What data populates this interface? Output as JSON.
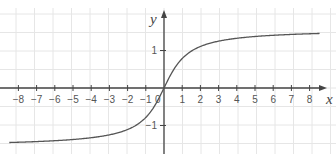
{
  "chart_data": {
    "type": "line",
    "title": "",
    "function": "y = arctan(x)",
    "xlabel": "x",
    "ylabel": "y",
    "xlim": [
      -8.5,
      9.2
    ],
    "ylim": [
      -1.75,
      2.35
    ],
    "x_ticks": [
      -8,
      -7,
      -6,
      -5,
      -4,
      -3,
      -2,
      -1,
      1,
      2,
      3,
      4,
      5,
      6,
      7,
      8
    ],
    "x_tick_labels": [
      "−8",
      "−7",
      "−6",
      "−5",
      "−4",
      "−3",
      "−2",
      "−1",
      "1",
      "2",
      "3",
      "4",
      "5",
      "6",
      "7",
      "8"
    ],
    "y_ticks": [
      1,
      -1
    ],
    "y_tick_labels": [
      "1",
      "−1"
    ],
    "origin_label": "0",
    "grid": true,
    "grid_step": 0.5,
    "series": [
      {
        "name": "arctan(x)",
        "x": [
          -8,
          -6,
          -4,
          -3,
          -2,
          -1,
          -0.5,
          0,
          0.5,
          1,
          2,
          3,
          4,
          6,
          8
        ],
        "values": [
          -1.45,
          -1.41,
          -1.33,
          -1.25,
          -1.11,
          -0.79,
          -0.46,
          0,
          0.46,
          0.79,
          1.11,
          1.25,
          1.33,
          1.41,
          1.45
        ]
      }
    ],
    "colors": {
      "curve": "#555555",
      "axis": "#444444",
      "grid": "#e6e6e6"
    }
  }
}
